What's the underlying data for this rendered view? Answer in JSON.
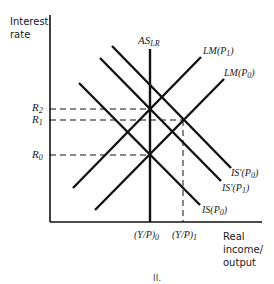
{
  "diagram": {
    "y_axis_label": [
      "Interest",
      "rate"
    ],
    "x_axis_label": [
      "Real",
      "income/",
      "output"
    ],
    "caption": "II.",
    "rate_levels": [
      {
        "label": "R",
        "sub": "2"
      },
      {
        "label": "R",
        "sub": "1"
      },
      {
        "label": "R",
        "sub": "0"
      }
    ],
    "output_levels": [
      {
        "label": "(Y/P)",
        "sub": "0"
      },
      {
        "label": "(Y/P)",
        "sub": "1"
      }
    ],
    "curves": {
      "as_lr": {
        "label": "AS",
        "sub": "LR"
      },
      "lm_p1": {
        "label": "LM(P",
        "sub": "1",
        "close": ")"
      },
      "lm_p0": {
        "label": "LM(P",
        "sub": "0",
        "close": ")"
      },
      "is_prime_p0": {
        "label": "IS′(P",
        "sub": "0",
        "close": ")"
      },
      "is_prime_p1": {
        "label": "IS′(P",
        "sub": "1",
        "close": ")"
      },
      "is_p0": {
        "label": "IS(P",
        "sub": "0",
        "close": ")"
      }
    },
    "colors": {
      "line": "#111111",
      "background": "#ffffff"
    }
  }
}
